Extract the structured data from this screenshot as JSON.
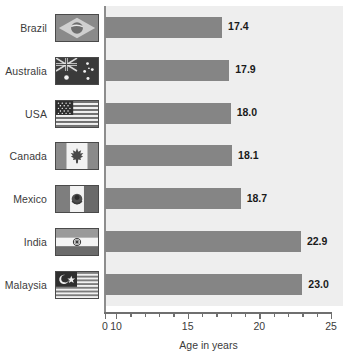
{
  "chart_data": {
    "type": "bar",
    "orientation": "horizontal",
    "title": "",
    "subtitle": "",
    "xlabel": "Age in years",
    "ylabel": "",
    "categories": [
      "Brazil",
      "Australia",
      "USA",
      "Canada",
      "Mexico",
      "India",
      "Malaysia"
    ],
    "values": [
      17.4,
      17.9,
      18.0,
      18.1,
      18.7,
      22.9,
      23.0
    ],
    "value_labels": [
      "17.4",
      "17.9",
      "18.0",
      "18.1",
      "18.7",
      "22.9",
      "23.0"
    ],
    "xlim": [
      0,
      25
    ],
    "axis_break": true,
    "axis_break_note": "axis jumps from 0 to 10",
    "xticks": [
      0,
      10,
      15,
      20,
      25
    ],
    "xtick_labels": [
      "0",
      "10",
      "15",
      "20",
      "25"
    ],
    "minor_tick_step": 1,
    "grid": false,
    "legend": null,
    "series": [
      {
        "name": "Age in years",
        "values": [
          17.4,
          17.9,
          18.0,
          18.1,
          18.7,
          22.9,
          23.0
        ]
      }
    ],
    "colors": {
      "bar": "#858585",
      "plot_background": "#eeeeee",
      "page_background": "#ffffff",
      "axis": "#6f6f6f",
      "text": "#3b3b3b",
      "value_text": "#1a1a1a"
    }
  },
  "rows": [
    {
      "label": "Brazil",
      "value": "17.4",
      "flag": "flag-brazil"
    },
    {
      "label": "Australia",
      "value": "17.9",
      "flag": "flag-australia"
    },
    {
      "label": "USA",
      "value": "18.0",
      "flag": "flag-usa"
    },
    {
      "label": "Canada",
      "value": "18.1",
      "flag": "flag-canada"
    },
    {
      "label": "Mexico",
      "value": "18.7",
      "flag": "flag-mexico"
    },
    {
      "label": "India",
      "value": "22.9",
      "flag": "flag-india"
    },
    {
      "label": "Malaysia",
      "value": "23.0",
      "flag": "flag-malaysia"
    }
  ],
  "axis": {
    "title": "Age in years",
    "ticks": [
      {
        "label": "0",
        "value": 0
      },
      {
        "label": "10",
        "value": 10
      },
      {
        "label": "15",
        "value": 15
      },
      {
        "label": "20",
        "value": 20
      },
      {
        "label": "25",
        "value": 25
      }
    ]
  }
}
